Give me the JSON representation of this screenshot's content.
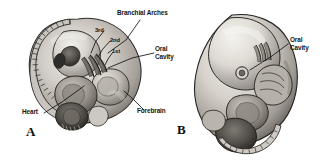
{
  "figure": {
    "caption_letters": [
      {
        "id": "panel-a",
        "text": "A"
      },
      {
        "id": "panel-b",
        "text": "B"
      }
    ],
    "background_color": "#ffffff",
    "ink_color": "#131313"
  },
  "panel_a": {
    "letter": "A",
    "labels": {
      "branchial_arches": "Branchial Arches",
      "arch_3rd": "3rd",
      "arch_2nd": "2nd",
      "arch_1st": "1st",
      "oral_cavity_line1": "Oral",
      "oral_cavity_line2": "Cavity",
      "heart": "Heart",
      "forebrain": "Forebrain"
    }
  },
  "panel_b": {
    "letter": "B",
    "labels": {
      "oral_cavity_line1": "Oral",
      "oral_cavity_line2": "Cavity"
    }
  },
  "illustration": {
    "type": "grayscale-halftone-drawing",
    "subject": "human embryo lateral view",
    "panel_a_description": "C-shaped embryo with segmented somites along dorsal curve, branchial arches, heart bulge and forebrain",
    "panel_b_description": "later-stage embryo with enlarged forebrain, limb buds and tail somites"
  }
}
